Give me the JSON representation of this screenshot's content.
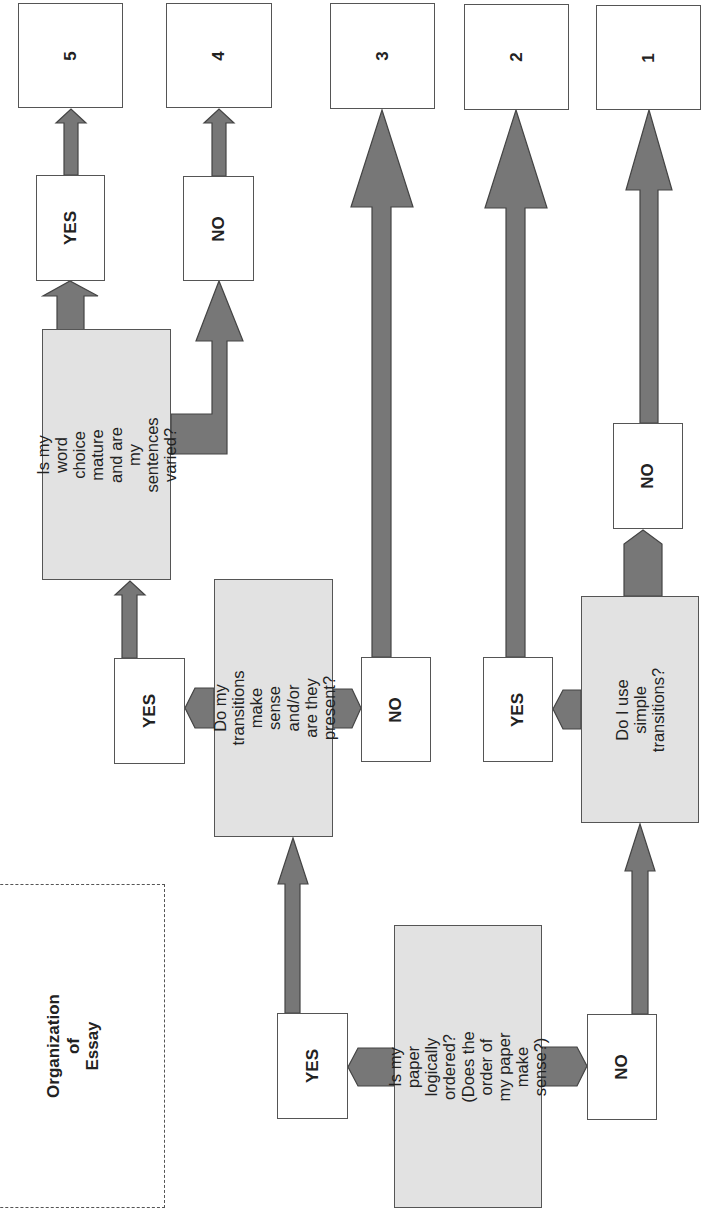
{
  "title": "Organization of\nEssay",
  "colors": {
    "arrow_fill": "#777777",
    "arrow_stroke": "#444444",
    "question_fill": "#e2e2e2",
    "box_border": "#555555"
  },
  "scores": [
    {
      "label": "5"
    },
    {
      "label": "4"
    },
    {
      "label": "3"
    },
    {
      "label": "2"
    },
    {
      "label": "1"
    }
  ],
  "questions": {
    "logical_order": "Is my paper logically\nordered? (Does the\norder of my paper\nmake sense?)",
    "transitions": "Do my transitions\nmake sense and/or\nare they present?",
    "word_choice": "Is my word choice\nmature and are my\nsentences varied?",
    "simple_transitions": "Do I use simple\ntransitions?"
  },
  "answers": {
    "logical_order_yes": "YES",
    "logical_order_no": "NO",
    "transitions_yes": "YES",
    "transitions_no": "NO",
    "word_choice_yes": "YES",
    "word_choice_no": "NO",
    "simple_yes": "YES",
    "simple_no": "NO"
  },
  "orientation": "rotated 90° counter-clockwise"
}
